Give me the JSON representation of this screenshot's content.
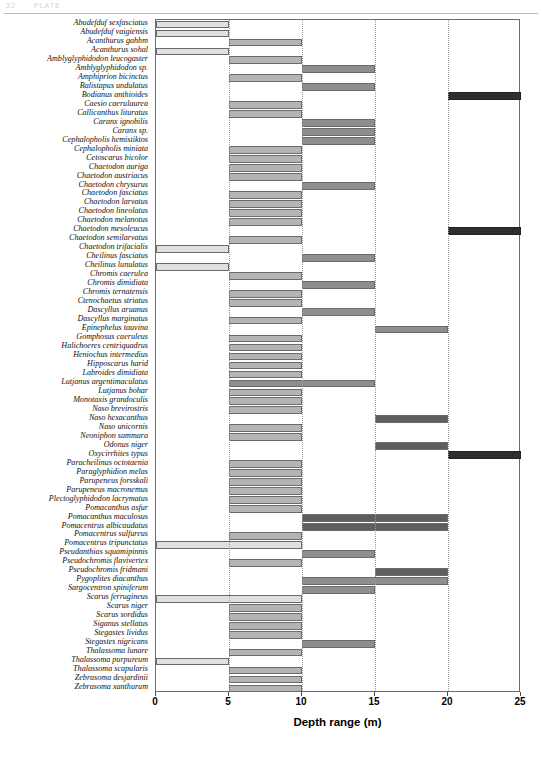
{
  "page_header": {
    "number": "32",
    "text": "PLATE"
  },
  "chart_data": {
    "type": "bar",
    "orientation": "horizontal",
    "title": "",
    "xlabel": "Depth range (m)",
    "ylabel": "",
    "xlim": [
      0,
      25
    ],
    "xticks": [
      0,
      5,
      10,
      15,
      20,
      25
    ],
    "xtick_labels": [
      "0",
      "5",
      "10",
      "15",
      "20",
      "25"
    ],
    "grid": "vertical-dotted",
    "legend": "none",
    "note": "Each species is drawn as a floating bar spanning its minimum to maximum depth. Empty rows indicate species with no plotted range in this figure.",
    "categories": [
      "Abudefduf sexfasciatus",
      "Abudefduf vaigiensis",
      "Acanthurus gahhm",
      "Acanthurus sohal",
      "Amblyglyphidodon leucogaster",
      "Amblyglyphidodon sp.",
      "Amphiprion bicinctus",
      "Balistapus undulatus",
      "Bodianus anthioides",
      "Caesio caerulaurea",
      "Callicanthus lituratus",
      "Caranx ignobilis",
      "Caranx sp.",
      "Cephalopholis hemistiktos",
      "Cephalopholis miniata",
      "Cetoscarus bicolor",
      "Chaetodon auriga",
      "Chaetodon austriacus",
      "Chaetodon chrysurus",
      "Chaetodon fasciatus",
      "Chaetodon larvatus",
      "Chaetodon lineolatus",
      "Chaetodon melanotus",
      "Chaetodon mesoleucus",
      "Chaetodon semilarvatus",
      "Chaetodon trifacialis",
      "Cheilinus fasciatus",
      "Cheilinus lunulatus",
      "Chromis caerulea",
      "Chromis dimidiata",
      "Chromis ternatensis",
      "Ctenochaetus striatus",
      "Dascyllus aruanus",
      "Dascyllus marginatus",
      "Epinephelus tauvina",
      "Gomphosus caeruleus",
      "Halichoeres centriquadrus",
      "Heniochus intermedius",
      "Hipposcarus harid",
      "Labroides dimidiata",
      "Lutjanus argentimaculatus",
      "Lutjanus bohar",
      "Monotaxis grandoculis",
      "Naso brevirostris",
      "Naso hexacanthus",
      "Naso unicornis",
      "Neoniphon sammara",
      "Odonus niger",
      "Oxycirrhites typus",
      "Paracheilinus octotaenia",
      "Paraglyphidion melas",
      "Parupeneus forsskali",
      "Parupeneus macronemus",
      "Plectoglyphidodon lacrymatus",
      "Pomacanthus asfur",
      "Pomacanthus maculosus",
      "Pomacentrus albicaudatus",
      "Pomacentrus sulfureus",
      "Pomacentrus tripunctatus",
      "Pseudanthias squamipinnis",
      "Pseudochromis flavivertex",
      "Pseudochromis fridmani",
      "Pygoplites diacanthus",
      "Sargocentron spiniferum",
      "Scarus ferrugineus",
      "Scarus niger",
      "Scarus sordidus",
      "Siganus stellatus",
      "Stegastes lividus",
      "Stegastes nigricans",
      "Thalassoma lunare",
      "Thalassoma purpureum",
      "Thalassoma scapularis",
      "Zebrasoma desjardinii",
      "Zebrasoma xanthurum"
    ],
    "bars": [
      {
        "category": "Abudefduf sexfasciatus",
        "min": 0,
        "max": 5,
        "shade": "light"
      },
      {
        "category": "Abudefduf vaigiensis",
        "min": 0,
        "max": 5,
        "shade": "light"
      },
      {
        "category": "Acanthurus gahhm",
        "min": 5,
        "max": 10,
        "shade": "mid"
      },
      {
        "category": "Acanthurus sohal",
        "min": 0,
        "max": 5,
        "shade": "light"
      },
      {
        "category": "Amblyglyphidodon leucogaster",
        "min": 5,
        "max": 10,
        "shade": "mid"
      },
      {
        "category": "Amblyglyphidodon sp.",
        "min": 10,
        "max": 15,
        "shade": "dark"
      },
      {
        "category": "Amphiprion bicinctus",
        "min": 5,
        "max": 10,
        "shade": "mid"
      },
      {
        "category": "Balistapus undulatus",
        "min": 10,
        "max": 15,
        "shade": "dark"
      },
      {
        "category": "Bodianus anthioides",
        "min": 20,
        "max": 25,
        "shade": "black"
      },
      {
        "category": "Caesio caerulaurea",
        "min": 5,
        "max": 10,
        "shade": "mid"
      },
      {
        "category": "Callicanthus lituratus",
        "min": 5,
        "max": 10,
        "shade": "mid"
      },
      {
        "category": "Caranx ignobilis",
        "min": 10,
        "max": 15,
        "shade": "dark"
      },
      {
        "category": "Caranx sp.",
        "min": 10,
        "max": 15,
        "shade": "dark"
      },
      {
        "category": "Cephalopholis hemistiktos",
        "min": 10,
        "max": 15,
        "shade": "dark"
      },
      {
        "category": "Cephalopholis miniata",
        "min": 5,
        "max": 10,
        "shade": "mid"
      },
      {
        "category": "Cetoscarus bicolor",
        "min": 5,
        "max": 10,
        "shade": "mid"
      },
      {
        "category": "Chaetodon auriga",
        "min": 5,
        "max": 10,
        "shade": "mid"
      },
      {
        "category": "Chaetodon austriacus",
        "min": 5,
        "max": 10,
        "shade": "mid"
      },
      {
        "category": "Chaetodon chrysurus",
        "min": 10,
        "max": 15,
        "shade": "dark"
      },
      {
        "category": "Chaetodon fasciatus",
        "min": 5,
        "max": 10,
        "shade": "mid"
      },
      {
        "category": "Chaetodon larvatus",
        "min": 5,
        "max": 10,
        "shade": "mid"
      },
      {
        "category": "Chaetodon lineolatus",
        "min": 5,
        "max": 10,
        "shade": "mid"
      },
      {
        "category": "Chaetodon melanotus",
        "min": 5,
        "max": 10,
        "shade": "mid"
      },
      {
        "category": "Chaetodon mesoleucus",
        "min": 20,
        "max": 25,
        "shade": "black"
      },
      {
        "category": "Chaetodon semilarvatus",
        "min": 5,
        "max": 10,
        "shade": "mid"
      },
      {
        "category": "Chaetodon trifacialis",
        "min": 0,
        "max": 5,
        "shade": "light"
      },
      {
        "category": "Cheilinus fasciatus",
        "min": 10,
        "max": 15,
        "shade": "dark"
      },
      {
        "category": "Cheilinus lunulatus",
        "min": 0,
        "max": 5,
        "shade": "light"
      },
      {
        "category": "Chromis caerulea",
        "min": 5,
        "max": 10,
        "shade": "mid"
      },
      {
        "category": "Chromis dimidiata",
        "min": 10,
        "max": 15,
        "shade": "dark"
      },
      {
        "category": "Chromis ternatensis",
        "min": 5,
        "max": 10,
        "shade": "mid"
      },
      {
        "category": "Ctenochaetus striatus",
        "min": 5,
        "max": 10,
        "shade": "mid"
      },
      {
        "category": "Dascyllus aruanus",
        "min": 10,
        "max": 15,
        "shade": "dark"
      },
      {
        "category": "Dascyllus marginatus",
        "min": 5,
        "max": 10,
        "shade": "mid"
      },
      {
        "category": "Epinephelus tauvina",
        "min": 15,
        "max": 20,
        "shade": "dark"
      },
      {
        "category": "Gomphosus caeruleus",
        "min": 5,
        "max": 10,
        "shade": "mid"
      },
      {
        "category": "Halichoeres centriquadrus",
        "min": 5,
        "max": 10,
        "shade": "mid"
      },
      {
        "category": "Heniochus intermedius",
        "min": 5,
        "max": 10,
        "shade": "mid"
      },
      {
        "category": "Hipposcarus harid",
        "min": 5,
        "max": 10,
        "shade": "mid"
      },
      {
        "category": "Labroides dimidiata",
        "min": 5,
        "max": 10,
        "shade": "mid"
      },
      {
        "category": "Lutjanus argentimaculatus",
        "min": 5,
        "max": 15,
        "shade": "dark"
      },
      {
        "category": "Lutjanus bohar",
        "min": 5,
        "max": 10,
        "shade": "mid"
      },
      {
        "category": "Monotaxis grandoculis",
        "min": 5,
        "max": 10,
        "shade": "mid"
      },
      {
        "category": "Naso brevirostris",
        "min": 5,
        "max": 10,
        "shade": "mid"
      },
      {
        "category": "Naso hexacanthus",
        "min": 15,
        "max": 20,
        "shade": "vdark"
      },
      {
        "category": "Naso unicornis",
        "min": 5,
        "max": 10,
        "shade": "mid"
      },
      {
        "category": "Neoniphon sammara",
        "min": 5,
        "max": 10,
        "shade": "mid"
      },
      {
        "category": "Odonus niger",
        "min": 15,
        "max": 20,
        "shade": "vdark"
      },
      {
        "category": "Oxycirrhites typus",
        "min": 20,
        "max": 25,
        "shade": "black"
      },
      {
        "category": "Paracheilinus octotaenia",
        "min": 5,
        "max": 10,
        "shade": "mid"
      },
      {
        "category": "Paraglyphidion melas",
        "min": 5,
        "max": 10,
        "shade": "mid"
      },
      {
        "category": "Parupeneus forsskali",
        "min": 5,
        "max": 10,
        "shade": "mid"
      },
      {
        "category": "Parupeneus macronemus",
        "min": 5,
        "max": 10,
        "shade": "mid"
      },
      {
        "category": "Plectoglyphidodon lacrymatus",
        "min": 5,
        "max": 10,
        "shade": "mid"
      },
      {
        "category": "Pomacanthus asfur",
        "min": 5,
        "max": 10,
        "shade": "mid"
      },
      {
        "category": "Pomacanthus maculosus",
        "min": 10,
        "max": 20,
        "shade": "vdark"
      },
      {
        "category": "Pomacentrus albicaudatus",
        "min": 10,
        "max": 20,
        "shade": "vdark"
      },
      {
        "category": "Pomacentrus sulfureus",
        "min": 5,
        "max": 10,
        "shade": "mid"
      },
      {
        "category": "Pomacentrus tripunctatus",
        "min": 0,
        "max": 10,
        "shade": "light"
      },
      {
        "category": "Pseudanthias squamipinnis",
        "min": 10,
        "max": 15,
        "shade": "dark"
      },
      {
        "category": "Pseudochromis flavivertex",
        "min": 5,
        "max": 10,
        "shade": "mid"
      },
      {
        "category": "Pseudochromis fridmani",
        "min": 15,
        "max": 20,
        "shade": "vdark"
      },
      {
        "category": "Pygoplites diacanthus",
        "min": 10,
        "max": 20,
        "shade": "dark"
      },
      {
        "category": "Sargocentron spiniferum",
        "min": 10,
        "max": 15,
        "shade": "dark"
      },
      {
        "category": "Scarus ferrugineus",
        "min": 0,
        "max": 10,
        "shade": "light"
      },
      {
        "category": "Scarus niger",
        "min": 5,
        "max": 10,
        "shade": "mid"
      },
      {
        "category": "Scarus sordidus",
        "min": 5,
        "max": 10,
        "shade": "mid"
      },
      {
        "category": "Siganus stellatus",
        "min": 5,
        "max": 10,
        "shade": "mid"
      },
      {
        "category": "Stegastes lividus",
        "min": 5,
        "max": 10,
        "shade": "mid"
      },
      {
        "category": "Stegastes nigricans",
        "min": 10,
        "max": 15,
        "shade": "dark"
      },
      {
        "category": "Thalassoma lunare",
        "min": 5,
        "max": 10,
        "shade": "mid"
      },
      {
        "category": "Thalassoma purpureum",
        "min": 0,
        "max": 5,
        "shade": "light"
      },
      {
        "category": "Thalassoma scapularis",
        "min": 5,
        "max": 10,
        "shade": "mid"
      },
      {
        "category": "Zebrasoma desjardinii",
        "min": 5,
        "max": 10,
        "shade": "mid"
      },
      {
        "category": "Zebrasoma xanthurum",
        "min": 5,
        "max": 10,
        "shade": "mid"
      }
    ]
  }
}
